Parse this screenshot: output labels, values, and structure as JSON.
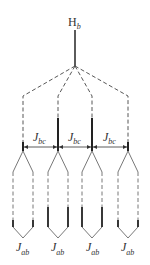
{
  "diagram": {
    "top_label": {
      "main": "H",
      "sub": "b"
    },
    "coupling_bc": {
      "main": "J",
      "sub": "bc"
    },
    "coupling_ab": {
      "main": "J",
      "sub": "ab"
    },
    "columns": 4,
    "line_color": "#333333"
  }
}
